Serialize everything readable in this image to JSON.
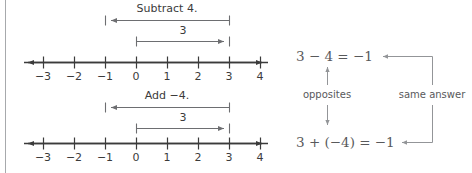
{
  "figure": {
    "title_alt": "Number line model showing subtracting 4 equals adding negative 4",
    "colors": {
      "background": "#ffffff",
      "axis": "#3b3b3b",
      "jump_arrow": "#6d6e71",
      "connector": "#939598",
      "equation_text": "#58595b",
      "border": "#a7a9ac"
    }
  },
  "numberlines": [
    {
      "id": "top",
      "ticks": [
        "−3",
        "−2",
        "−1",
        "0",
        "1",
        "2",
        "3",
        "4"
      ],
      "operation_label": "Subtract 4.",
      "operation_from": "3",
      "operation_to": "−1",
      "span_label": "3",
      "span_from": "0",
      "span_to": "3"
    },
    {
      "id": "bottom",
      "ticks": [
        "−3",
        "−2",
        "−1",
        "0",
        "1",
        "2",
        "3",
        "4"
      ],
      "operation_label": "Add −4.",
      "operation_from": "3",
      "operation_to": "−1",
      "span_label": "3",
      "span_from": "0",
      "span_to": "3"
    }
  ],
  "equations": {
    "top": "3 − 4 = −1",
    "bottom": "3 + (−4) = −1"
  },
  "connectors": {
    "opposites_label": "opposites",
    "same_answer_label": "same answer"
  }
}
